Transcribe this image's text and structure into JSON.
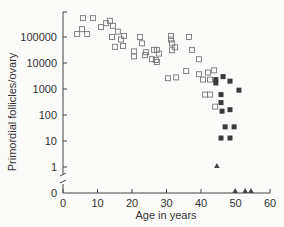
{
  "chart_data": {
    "type": "scatter",
    "title": "",
    "xlabel": "Age in years",
    "ylabel": "Primordial follicles/ovary",
    "xlim": [
      0,
      60
    ],
    "x_ticks": [
      0,
      10,
      20,
      30,
      40,
      50,
      60
    ],
    "y_scale": "log (with axis break to 0)",
    "y_ticks": [
      "100000",
      "10000",
      "1000",
      "100",
      "10",
      "1",
      "0"
    ],
    "grid": false,
    "legend": null,
    "series": [
      {
        "name": "open-squares",
        "marker": "open-square",
        "points": [
          [
            5.8,
            530000
          ],
          [
            8.7,
            530000
          ],
          [
            5.5,
            200000
          ],
          [
            4.1,
            130000
          ],
          [
            7,
            130000
          ],
          [
            11,
            240000
          ],
          [
            12.5,
            340000
          ],
          [
            13.6,
            420000
          ],
          [
            14.5,
            270000
          ],
          [
            15.9,
            160000
          ],
          [
            14.2,
            100000
          ],
          [
            17.7,
            110000
          ],
          [
            16.8,
            80000
          ],
          [
            15.1,
            42000
          ],
          [
            17.4,
            45000
          ],
          [
            20.6,
            28000
          ],
          [
            20.6,
            18000
          ],
          [
            22.3,
            100000
          ],
          [
            22.9,
            57000
          ],
          [
            23.8,
            20000
          ],
          [
            24.1,
            26000
          ],
          [
            26.4,
            32000
          ],
          [
            27.2,
            32000
          ],
          [
            25.8,
            14000
          ],
          [
            26.9,
            13000
          ],
          [
            27.8,
            23000
          ],
          [
            27.2,
            11000
          ],
          [
            31.3,
            110000
          ],
          [
            31.6,
            57000
          ],
          [
            31.6,
            31000
          ],
          [
            32.5,
            40000
          ],
          [
            31.3,
            80000
          ],
          [
            30.4,
            2600
          ],
          [
            35.7,
            4900
          ],
          [
            32.8,
            2800
          ],
          [
            36.5,
            100000
          ],
          [
            37.4,
            32000
          ],
          [
            39.4,
            14000
          ],
          [
            39.4,
            3700
          ],
          [
            43.8,
            5200
          ],
          [
            42.6,
            2300
          ],
          [
            42,
            4300
          ],
          [
            41.2,
            610
          ],
          [
            40.6,
            2300
          ],
          [
            44.1,
            210
          ],
          [
            42.6,
            610
          ]
        ]
      },
      {
        "name": "filled-squares",
        "marker": "filled-square",
        "points": [
          [
            44.3,
            2300
          ],
          [
            46.4,
            3000
          ],
          [
            44.3,
            1700
          ],
          [
            48.4,
            2000
          ],
          [
            51,
            900
          ],
          [
            45.8,
            610
          ],
          [
            45.8,
            300
          ],
          [
            46.1,
            140
          ],
          [
            48.4,
            160
          ],
          [
            47,
            35
          ],
          [
            49.6,
            35
          ],
          [
            45.8,
            13
          ],
          [
            48.4,
            13
          ]
        ]
      },
      {
        "name": "triangles",
        "marker": "filled-triangle",
        "points": [
          [
            44.6,
            1
          ],
          [
            49.9,
            0
          ],
          [
            52.8,
            0
          ],
          [
            54.5,
            0
          ]
        ]
      }
    ]
  },
  "axes": {
    "y_tick_labels": [
      "100000",
      "10000",
      "1000",
      "100",
      "10",
      "1",
      "0"
    ],
    "x_tick_labels": [
      "0",
      "10",
      "20",
      "30",
      "40",
      "50",
      "60"
    ],
    "xlabel": "Age in years",
    "ylabel": "Primordial follicles/ovary"
  }
}
